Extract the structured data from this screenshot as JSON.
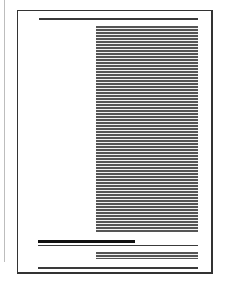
{
  "document": {
    "type": "page-layout-thumbnail",
    "content": "greeked text (no legible text)",
    "elements": [
      {
        "name": "header-rule",
        "kind": "rule"
      },
      {
        "name": "body-text-column",
        "kind": "greeked-text",
        "approx_lines": 68
      },
      {
        "name": "caption-heading-bar",
        "kind": "bold-bar"
      },
      {
        "name": "caption-rule",
        "kind": "rule"
      },
      {
        "name": "footnote-text",
        "kind": "greeked-text",
        "approx_lines": 3
      },
      {
        "name": "footer-rule",
        "kind": "rule"
      }
    ]
  },
  "colors": {
    "border": "#333333",
    "text": "#555555",
    "background": "#ffffff"
  }
}
